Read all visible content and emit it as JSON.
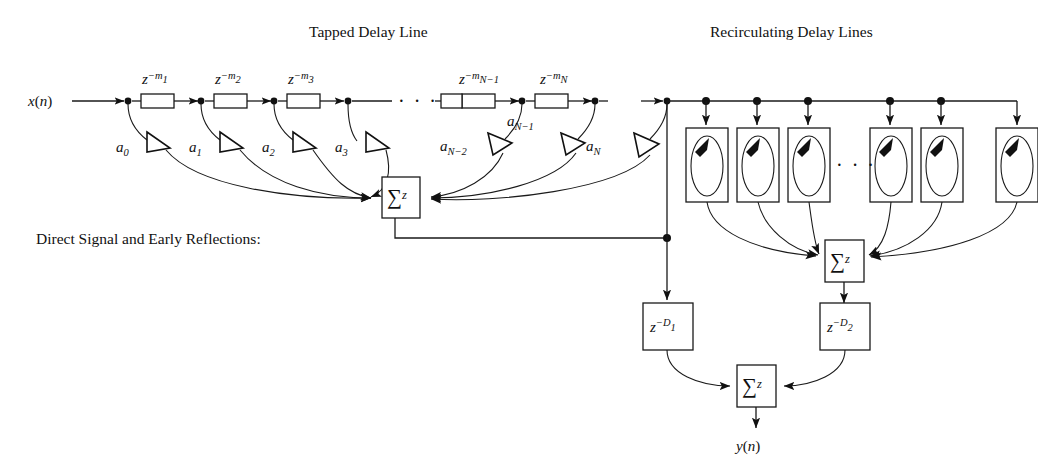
{
  "figure": {
    "title_left": "Tapped Delay Line",
    "title_right": "Recirculating Delay Lines",
    "caption_left": "Direct Signal and Early Reflections:",
    "input_label": "x(n)",
    "output_label": "y(n)",
    "ellipsis": "· · ·",
    "colors": {
      "ink": "#111111",
      "line": "#1a1a1a",
      "background": "#ffffff"
    }
  },
  "tapped_delay_line": {
    "input": {
      "var": "x",
      "arg": "(n)"
    },
    "delay_blocks": [
      {
        "base": "z",
        "exp_prefix": "−",
        "exp_var": "m",
        "exp_sub": "1",
        "label": "z^-m_1"
      },
      {
        "base": "z",
        "exp_prefix": "−",
        "exp_var": "m",
        "exp_sub": "2",
        "label": "z^-m_2"
      },
      {
        "base": "z",
        "exp_prefix": "−",
        "exp_var": "m",
        "exp_sub": "3",
        "label": "z^-m_3"
      },
      {
        "base": "z",
        "exp_prefix": "−",
        "exp_var": "m",
        "exp_sub": "N−1",
        "label": "z^-m_N-1"
      },
      {
        "base": "z",
        "exp_prefix": "−",
        "exp_var": "m",
        "exp_sub": "N",
        "label": "z^-m_N"
      }
    ],
    "gains": [
      {
        "var": "a",
        "sub": "0",
        "label": "a_0"
      },
      {
        "var": "a",
        "sub": "1",
        "label": "a_1"
      },
      {
        "var": "a",
        "sub": "2",
        "label": "a_2"
      },
      {
        "var": "a",
        "sub": "3",
        "label": "a_3"
      },
      {
        "var": "a",
        "sub": "N−2",
        "label": "a_N-2"
      },
      {
        "var": "a",
        "sub": "N−1",
        "label": "a_N-1"
      },
      {
        "var": "a",
        "sub": "N",
        "label": "a_N"
      }
    ],
    "summer": {
      "symbol": "∑",
      "operand": "z"
    }
  },
  "recirculating": {
    "comb_filter_count_drawn": 6,
    "summer": {
      "symbol": "∑",
      "operand": "z"
    },
    "ellipsis": "· · ·"
  },
  "output_stage": {
    "delay_left": {
      "base": "z",
      "exp_prefix": "−",
      "exp_var": "D",
      "exp_sub": "1",
      "label": "z^-D_1"
    },
    "delay_right": {
      "base": "z",
      "exp_prefix": "−",
      "exp_var": "D",
      "exp_sub": "2",
      "label": "z^-D_2"
    },
    "summer": {
      "symbol": "∑",
      "operand": "z"
    },
    "output": {
      "var": "y",
      "arg": "(n)"
    }
  }
}
